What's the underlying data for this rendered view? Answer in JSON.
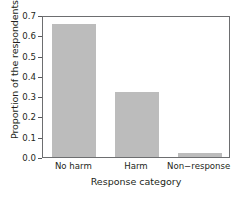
{
  "chart_data": {
    "type": "bar",
    "title": "",
    "subtitle": "",
    "xlabel": "Response category",
    "ylabel": "Proportion of the respondents",
    "categories": [
      "No harm",
      "Harm",
      "Non−response"
    ],
    "values": [
      0.655,
      0.32,
      0.02
    ],
    "series": [
      {
        "name": "Proportion of the respondents",
        "values": [
          0.655,
          0.32,
          0.02
        ]
      }
    ],
    "ylim": [
      0.0,
      0.7
    ],
    "yticks": [
      0.0,
      0.1,
      0.2,
      0.3,
      0.4,
      0.5,
      0.6,
      0.7
    ],
    "ytick_labels": [
      "0.0",
      "0.1",
      "0.2",
      "0.3",
      "0.4",
      "0.5",
      "0.6",
      "0.7"
    ],
    "grid": false,
    "legend": false,
    "legend_position": "none",
    "bar_color": "#bcbcbc",
    "frame_color": "#6d6e70",
    "text_color": "#231f20"
  }
}
